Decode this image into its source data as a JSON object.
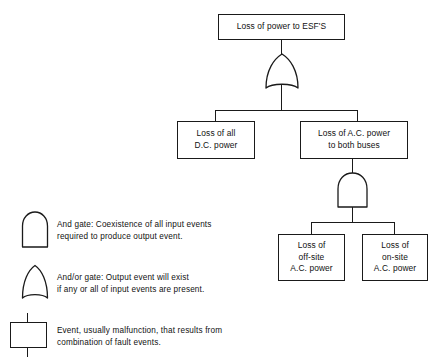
{
  "diagram": {
    "type": "fault-tree",
    "title_text": "",
    "colors": {
      "stroke": "#1a1a1a",
      "background": "#ffffff",
      "text": "#111111"
    },
    "nodes": {
      "top_event": {
        "label": "Loss of power to ESF'S",
        "x": 218,
        "y": 14,
        "w": 127,
        "h": 26
      },
      "dc_power": {
        "label": "Loss of all\nD.C. power",
        "x": 177,
        "y": 121,
        "w": 78,
        "h": 38
      },
      "ac_buses": {
        "label": "Loss of A.C. power\nto both buses",
        "x": 300,
        "y": 121,
        "w": 108,
        "h": 38
      },
      "offsite_ac": {
        "label": "Loss of\noff-site\nA.C. power",
        "x": 278,
        "y": 234,
        "w": 67,
        "h": 47
      },
      "onsite_ac": {
        "label": "Loss of\non-site\nA.C. power",
        "x": 362,
        "y": 234,
        "w": 66,
        "h": 47
      }
    },
    "gates": {
      "or_gate_top": {
        "kind": "or",
        "x": 264,
        "y": 54,
        "w": 36,
        "h": 38
      },
      "and_gate_mid": {
        "kind": "and",
        "x": 336,
        "y": 172,
        "w": 33,
        "h": 36
      }
    }
  },
  "legend": {
    "items": [
      {
        "symbol": "and-gate-symbol",
        "text": "And gate:  Coexistence of all input events\nrequired to produce output event."
      },
      {
        "symbol": "or-gate-symbol",
        "text": "And/or gate:  Output event will exist\nif any or all of input events are present."
      },
      {
        "symbol": "event-box-symbol",
        "text": "Event, usually malfunction, that results from\ncombination of fault events."
      }
    ]
  }
}
